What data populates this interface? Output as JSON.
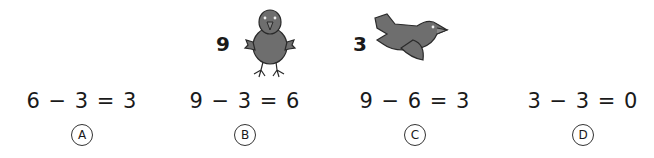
{
  "picture": {
    "standing_bird": {
      "count": "9",
      "icon": "standing-bird-icon"
    },
    "flying_bird": {
      "count": "3",
      "icon": "flying-bird-icon"
    }
  },
  "options": [
    {
      "equation": "6 − 3 = 3",
      "label": "A"
    },
    {
      "equation": "9 − 3 = 6",
      "label": "B"
    },
    {
      "equation": "9 − 6 = 3",
      "label": "C"
    },
    {
      "equation": "3 − 3 = 0",
      "label": "D"
    }
  ],
  "colors": {
    "bird_fill": "#6e6e6e",
    "bird_outline": "#2a2a2a",
    "text": "#1a1a1a"
  }
}
